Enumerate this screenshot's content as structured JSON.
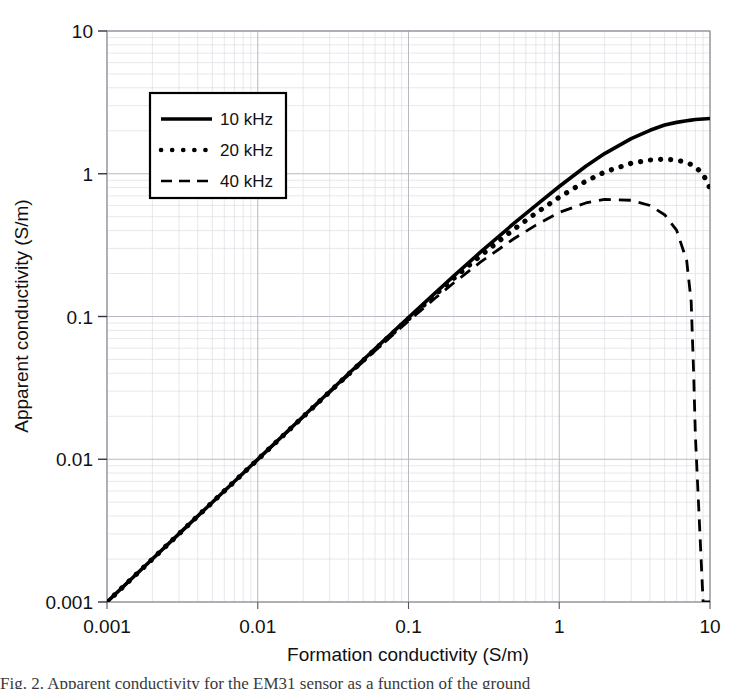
{
  "figure": {
    "background_color": "#ffffff",
    "foreground_color": "#000000",
    "grid_major_color": "#b9b9c2",
    "grid_minor_color": "#dedee4",
    "plot_frame_color": "#8a8a94",
    "caption_partial": "Fig. 2. Apparent conductivity for the EM31 sensor as a function of the ground"
  },
  "axes": {
    "x": {
      "title": "Formation conductivity (S/m)",
      "tick_labels": [
        "0.001",
        "0.01",
        "0.1",
        "1",
        "10"
      ],
      "tick_values": [
        0.001,
        0.01,
        0.1,
        1,
        10
      ],
      "scale": "log",
      "min": 0.001,
      "max": 10
    },
    "y": {
      "title": "Apparent conductivity (S/m)",
      "tick_labels": [
        "0.001",
        "0.01",
        "0.1",
        "1",
        "10"
      ],
      "tick_values": [
        0.001,
        0.01,
        0.1,
        1,
        10
      ],
      "scale": "log",
      "min": 0.001,
      "max": 10
    }
  },
  "legend": {
    "position": "upper-left-inside",
    "entries": [
      {
        "label": "10 kHz",
        "style": "solid"
      },
      {
        "label": "20 kHz",
        "style": "dotted"
      },
      {
        "label": "40 kHz",
        "style": "dashed"
      }
    ]
  },
  "chart_data": {
    "type": "line",
    "title": "",
    "xlabel": "Formation conductivity (S/m)",
    "ylabel": "Apparent conductivity (S/m)",
    "xscale": "log",
    "yscale": "log",
    "xlim": [
      0.001,
      10
    ],
    "ylim": [
      0.001,
      10
    ],
    "grid": true,
    "legend_position": "upper-left-inside",
    "x": [
      0.001,
      0.002,
      0.003,
      0.005,
      0.007,
      0.01,
      0.02,
      0.03,
      0.05,
      0.07,
      0.1,
      0.15,
      0.2,
      0.3,
      0.5,
      0.7,
      1.0,
      1.5,
      2.0,
      3.0,
      4.0,
      5.0,
      6.0,
      7.0,
      7.5,
      7.8,
      8.0,
      9.0,
      10.0
    ],
    "series": [
      {
        "name": "10 kHz",
        "style": "solid",
        "values": [
          0.001,
          0.002,
          0.003,
          0.005,
          0.00699,
          0.00998,
          0.01993,
          0.02985,
          0.04957,
          0.06915,
          0.0982,
          0.1459,
          0.1925,
          0.2822,
          0.4487,
          0.6014,
          0.8142,
          1.128,
          1.384,
          1.764,
          2.016,
          2.193,
          2.29,
          2.35,
          2.375,
          2.39,
          2.4,
          2.42,
          2.44
        ]
      },
      {
        "name": "20 kHz",
        "style": "dotted",
        "values": [
          0.001,
          0.002,
          0.003,
          0.005,
          0.00699,
          0.00996,
          0.01986,
          0.0297,
          0.04914,
          0.06829,
          0.09645,
          0.1418,
          0.1853,
          0.2662,
          0.4081,
          0.5297,
          0.6846,
          0.8868,
          1.028,
          1.184,
          1.248,
          1.265,
          1.247,
          1.198,
          1.161,
          1.135,
          1.115,
          0.995,
          0.79
        ]
      },
      {
        "name": "40 kHz",
        "style": "dashed",
        "values": [
          0.001,
          0.002,
          0.003,
          0.005,
          0.00698,
          0.00993,
          0.01972,
          0.02941,
          0.04829,
          0.06663,
          0.09305,
          0.1343,
          0.1724,
          0.2402,
          0.3505,
          0.4368,
          0.5356,
          0.6243,
          0.6616,
          0.6523,
          0.5993,
          0.5166,
          0.4029,
          0.2469,
          0.1274,
          0.0385,
          0.0146,
          0.001,
          0.001
        ]
      }
    ]
  }
}
